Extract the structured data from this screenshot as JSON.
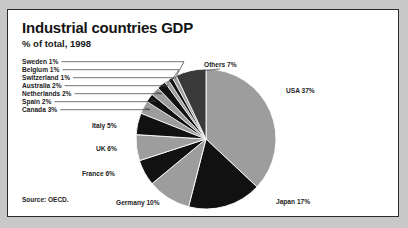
{
  "panel": {
    "title": "Industrial countries GDP",
    "subtitle": "% of total, 1998",
    "source": "Source: OECD."
  },
  "colors": {
    "background": "#c8c8c8",
    "panel": "#ffffff",
    "border": "#2b2b2b",
    "text": "#1c1c1c",
    "slice_light": "#9d9d9d",
    "slice_dark": "#111111",
    "slice_others": "#3a3a3a",
    "leader_line": "#3a3a3a"
  },
  "chart_data": {
    "type": "pie",
    "title": "Industrial countries GDP",
    "subtitle": "% of total, 1998",
    "unit": "%",
    "source": "Source: OECD.",
    "start_angle_deg": 0,
    "direction": "clockwise",
    "legend": "none",
    "labels_inline": true,
    "categories": [
      "USA",
      "Japan",
      "Germany",
      "France",
      "UK",
      "Italy",
      "Canada",
      "Spain",
      "Netherlands",
      "Australia",
      "Switzerland",
      "Belgium",
      "Sweden",
      "Others"
    ],
    "values": [
      37,
      17,
      10,
      6,
      6,
      5,
      3,
      2,
      2,
      2,
      1,
      1,
      1,
      7
    ],
    "slices": [
      {
        "name": "USA",
        "value": 37,
        "label": "USA 37%",
        "fill": "#9d9d9d",
        "label_mode": "outside-right"
      },
      {
        "name": "Japan",
        "value": 17,
        "label": "Japan 17%",
        "fill": "#111111",
        "label_mode": "outside-right"
      },
      {
        "name": "Germany",
        "value": 10,
        "label": "Germany 10%",
        "fill": "#9d9d9d",
        "label_mode": "outside-left"
      },
      {
        "name": "France",
        "value": 6,
        "label": "France 6%",
        "fill": "#111111",
        "label_mode": "outside-left"
      },
      {
        "name": "UK",
        "value": 6,
        "label": "UK 6%",
        "fill": "#9d9d9d",
        "label_mode": "outside-left"
      },
      {
        "name": "Italy",
        "value": 5,
        "label": "Italy 5%",
        "fill": "#111111",
        "label_mode": "outside-left"
      },
      {
        "name": "Canada",
        "value": 3,
        "label": "Canada 3%",
        "fill": "#9d9d9d",
        "label_mode": "leader-line"
      },
      {
        "name": "Spain",
        "value": 2,
        "label": "Spain 2%",
        "fill": "#111111",
        "label_mode": "leader-line"
      },
      {
        "name": "Netherlands",
        "value": 2,
        "label": "Netherlands 2%",
        "fill": "#9d9d9d",
        "label_mode": "leader-line"
      },
      {
        "name": "Australia",
        "value": 2,
        "label": "Australia 2%",
        "fill": "#111111",
        "label_mode": "leader-line"
      },
      {
        "name": "Switzerland",
        "value": 1,
        "label": "Switzerland 1%",
        "fill": "#9d9d9d",
        "label_mode": "leader-line"
      },
      {
        "name": "Belgium",
        "value": 1,
        "label": "Belgium 1%",
        "fill": "#111111",
        "label_mode": "leader-line"
      },
      {
        "name": "Sweden",
        "value": 1,
        "label": "Sweden 1%",
        "fill": "#9d9d9d",
        "label_mode": "leader-line"
      },
      {
        "name": "Others",
        "value": 7,
        "label": "Others 7%",
        "fill": "#3a3a3a",
        "label_mode": "outside-top"
      }
    ]
  }
}
